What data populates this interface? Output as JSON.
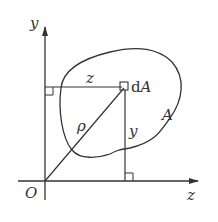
{
  "diagram": {
    "title": "",
    "axes": {
      "vertical": {
        "label": "y"
      },
      "horizontal": {
        "label": "z"
      },
      "origin": {
        "label": "O"
      }
    },
    "region": {
      "label": "A"
    },
    "element": {
      "label_prefix": "d",
      "label_var": "A"
    },
    "distances": {
      "horizontal": {
        "label": "z"
      },
      "vertical": {
        "label": "y"
      },
      "radial": {
        "label": "ρ"
      }
    },
    "colors": {
      "stroke": "#333333",
      "background": "#ffffff"
    }
  }
}
